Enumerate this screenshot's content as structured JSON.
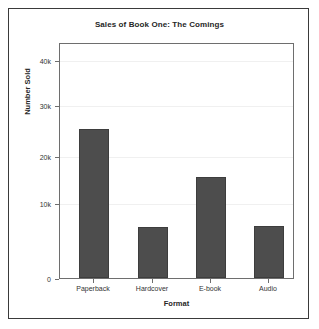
{
  "chart_data": {
    "type": "bar",
    "title": "Sales of Book One: The Comings",
    "xlabel": "Format",
    "ylabel": "Number Sold",
    "categories": [
      "Paperback",
      "Hardcover",
      "E-book",
      "Audio"
    ],
    "values": [
      30000,
      10300,
      20200,
      10500
    ],
    "series": [
      {
        "name": "Number Sold",
        "values": [
          30000,
          10300,
          20200,
          10500
        ]
      }
    ],
    "ylim": [
      0,
      47000
    ],
    "yticks": [
      0,
      10000,
      20000,
      30000,
      40000
    ],
    "ytick_labels": [
      "0",
      "10k",
      "20k",
      "30k",
      "40k"
    ],
    "xtick_labels": [
      "Paperback",
      "Hardcover",
      "E-book",
      "Audio"
    ],
    "grid": true,
    "grid_axis": "y",
    "legend": false,
    "legend_position": "none",
    "bar_color": "#4d4d4d",
    "bar_edge_color": "#3d3d3d",
    "plot_background": "#ffffff",
    "figure_border_color": "#3a3a3a",
    "axis_color": "#6e6e6e",
    "text_color": "#262626"
  },
  "figure": {
    "title": "Sales of Book One: The Comings"
  },
  "axes": {
    "x": {
      "title": "Format",
      "ticks": [
        {
          "label": "Paperback"
        },
        {
          "label": "Hardcover"
        },
        {
          "label": "E-book"
        },
        {
          "label": "Audio"
        }
      ]
    },
    "y": {
      "title": "Number Sold",
      "ticks": [
        {
          "label": "40k"
        },
        {
          "label": "30k"
        },
        {
          "label": "20k"
        },
        {
          "label": "10k"
        },
        {
          "label": "0"
        }
      ]
    }
  }
}
